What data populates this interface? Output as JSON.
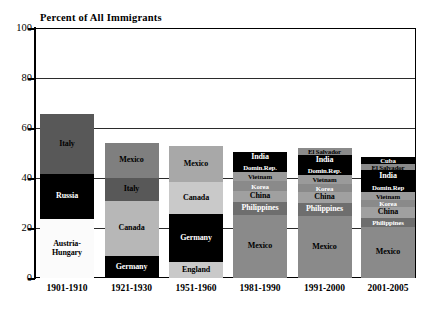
{
  "chart_data": {
    "type": "bar",
    "subtype": "stacked-bar",
    "title": "Percent of All Immigrants",
    "xlabel": "",
    "ylabel": "",
    "ylim": [
      0,
      100
    ],
    "yticks": [
      0,
      20,
      40,
      60,
      80,
      100
    ],
    "grid": true,
    "legend": "none",
    "categories": [
      "1901-1910",
      "1921-1930",
      "1951-1960",
      "1981-1990",
      "1991-2000",
      "2001-2005"
    ],
    "bar_totals": [
      65.6,
      54.0,
      52.8,
      50.4,
      52.0,
      48.4
    ],
    "colors": {
      "black": "#000000",
      "dark_gray": "#585858",
      "medium_gray": "#7f7f7f",
      "light_gray": "#b7b7b7",
      "pale_gray": "#d4d4d4",
      "white": "#fbfbfb",
      "grid": "#2b2b2b",
      "axis": "#000000"
    },
    "bars": [
      {
        "period": "1901-1910",
        "total": 65.6,
        "segments": [
          {
            "label": "Italy",
            "value": 24.0,
            "color": "#585858",
            "text_color": "#000000"
          },
          {
            "label": "Russia",
            "value": 18.0,
            "color": "#000000",
            "text_color": "#ffffff"
          },
          {
            "label": "Austria-Hungary",
            "value": 23.6,
            "color": "#fbfbfb",
            "text_color": "#000000"
          }
        ]
      },
      {
        "period": "1921-1930",
        "total": 54.0,
        "segments": [
          {
            "label": "Mexico",
            "value": 14.0,
            "color": "#7f7f7f",
            "text_color": "#000000"
          },
          {
            "label": "Italy",
            "value": 9.0,
            "color": "#585858",
            "text_color": "#000000"
          },
          {
            "label": "Canada",
            "value": 22.0,
            "color": "#b7b7b7",
            "text_color": "#000000"
          },
          {
            "label": "Germany",
            "value": 9.0,
            "color": "#000000",
            "text_color": "#ffffff"
          }
        ]
      },
      {
        "period": "1951-1960",
        "total": 52.8,
        "segments": [
          {
            "label": "Mexico",
            "value": 14.4,
            "color": "#a8a8a8",
            "text_color": "#000000"
          },
          {
            "label": "Canada",
            "value": 12.8,
            "color": "#c9c9c9",
            "text_color": "#000000"
          },
          {
            "label": "Germany",
            "value": 19.2,
            "color": "#000000",
            "text_color": "#ffffff"
          },
          {
            "label": "England",
            "value": 6.4,
            "color": "#c9c9c9",
            "text_color": "#000000"
          }
        ]
      },
      {
        "period": "1981-1990",
        "total": 50.4,
        "segments": [
          {
            "label": "India",
            "value": 4.4,
            "color": "#000000",
            "text_color": "#ffffff"
          },
          {
            "label": "Domin.Rep.",
            "value": 3.6,
            "color": "#000000",
            "text_color": "#ffffff"
          },
          {
            "label": "Vietnam",
            "value": 3.6,
            "color": "#9a9a9a",
            "text_color": "#000000"
          },
          {
            "label": "Korea",
            "value": 4.0,
            "color": "#8a8a8a",
            "text_color": "#ffffff"
          },
          {
            "label": "China",
            "value": 4.4,
            "color": "#a0a0a0",
            "text_color": "#000000"
          },
          {
            "label": "Philippines",
            "value": 5.2,
            "color": "#6e6e6e",
            "text_color": "#ffffff"
          },
          {
            "label": "Mexico",
            "value": 25.2,
            "color": "#8a8a8a",
            "text_color": "#000000"
          }
        ]
      },
      {
        "period": "1991-2000",
        "total": 52.0,
        "segments": [
          {
            "label": "El Salvador",
            "value": 2.8,
            "color": "#8a8a8a",
            "text_color": "#000000"
          },
          {
            "label": "India",
            "value": 4.4,
            "color": "#000000",
            "text_color": "#ffffff"
          },
          {
            "label": "Domin.Rep.",
            "value": 3.6,
            "color": "#000000",
            "text_color": "#ffffff"
          },
          {
            "label": "Vietnam",
            "value": 3.6,
            "color": "#9a9a9a",
            "text_color": "#000000"
          },
          {
            "label": "Korea",
            "value": 3.2,
            "color": "#8a8a8a",
            "text_color": "#ffffff"
          },
          {
            "label": "China",
            "value": 4.4,
            "color": "#a0a0a0",
            "text_color": "#000000"
          },
          {
            "label": "Philippines",
            "value": 5.2,
            "color": "#6e6e6e",
            "text_color": "#ffffff"
          },
          {
            "label": "Mexico",
            "value": 24.8,
            "color": "#8a8a8a",
            "text_color": "#000000"
          }
        ]
      },
      {
        "period": "2001-2005",
        "total": 48.4,
        "segments": [
          {
            "label": "Cuba",
            "value": 2.8,
            "color": "#000000",
            "text_color": "#ffffff"
          },
          {
            "label": "El Salvador",
            "value": 2.4,
            "color": "#8a8a8a",
            "text_color": "#000000"
          },
          {
            "label": "India",
            "value": 5.2,
            "color": "#000000",
            "text_color": "#ffffff"
          },
          {
            "label": "Domin.Rep",
            "value": 3.6,
            "color": "#000000",
            "text_color": "#ffffff"
          },
          {
            "label": "Vietnam",
            "value": 3.2,
            "color": "#9a9a9a",
            "text_color": "#000000"
          },
          {
            "label": "Korea",
            "value": 2.8,
            "color": "#8a8a8a",
            "text_color": "#ffffff"
          },
          {
            "label": "China",
            "value": 4.4,
            "color": "#a0a0a0",
            "text_color": "#000000"
          },
          {
            "label": "Philippines",
            "value": 3.6,
            "color": "#6e6e6e",
            "text_color": "#ffffff"
          },
          {
            "label": "Mexico",
            "value": 20.4,
            "color": "#8a8a8a",
            "text_color": "#000000"
          }
        ]
      }
    ]
  }
}
